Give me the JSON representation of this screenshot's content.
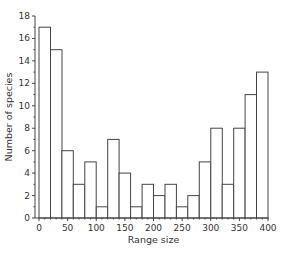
{
  "chart_data": {
    "type": "bar",
    "title": "",
    "xlabel": "Range size",
    "ylabel": "Number of species",
    "bin_width": 20,
    "bin_starts": [
      0,
      20,
      40,
      60,
      80,
      100,
      120,
      140,
      160,
      180,
      200,
      220,
      240,
      260,
      280,
      300,
      320,
      340,
      360,
      380
    ],
    "values": [
      17,
      15,
      6,
      3,
      5,
      1,
      7,
      4,
      1,
      3,
      2,
      3,
      1,
      2,
      5,
      8,
      3,
      8,
      11,
      13
    ],
    "xlim": [
      0,
      400
    ],
    "ylim": [
      0,
      18
    ],
    "xticks": [
      0,
      50,
      100,
      150,
      200,
      250,
      300,
      350,
      400
    ],
    "yticks": [
      0,
      2,
      4,
      6,
      8,
      10,
      12,
      14,
      16,
      18
    ],
    "grid": false,
    "legend": null
  }
}
